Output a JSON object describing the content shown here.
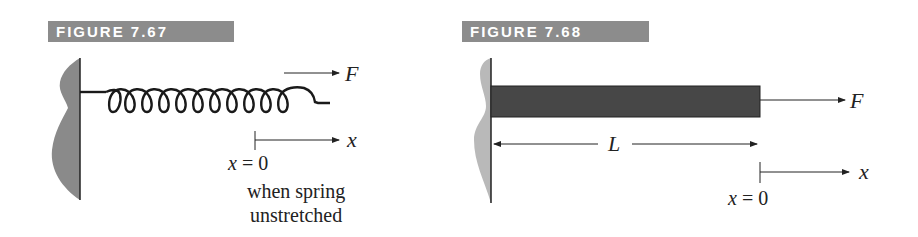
{
  "figures": [
    {
      "label": "FIGURE 7.67",
      "description": "Spring attached to wall, pulled by force F",
      "force_label": "F",
      "axis_label": "x",
      "origin_label": "x = 0",
      "note_line1": "when spring",
      "note_line2": "unstretched"
    },
    {
      "label": "FIGURE 7.68",
      "description": "Bar of length L attached to wall, pulled by force F",
      "force_label": "F",
      "length_label": "L",
      "axis_label": "x",
      "origin_label": "x = 0"
    }
  ],
  "colors": {
    "label_bg": "#8c8c8c",
    "label_text": "#ffffff",
    "wall_fill_1": "#8a8a8a",
    "wall_fill_2": "#b9b9b9",
    "bar_fill": "#474747",
    "line": "#222222"
  }
}
